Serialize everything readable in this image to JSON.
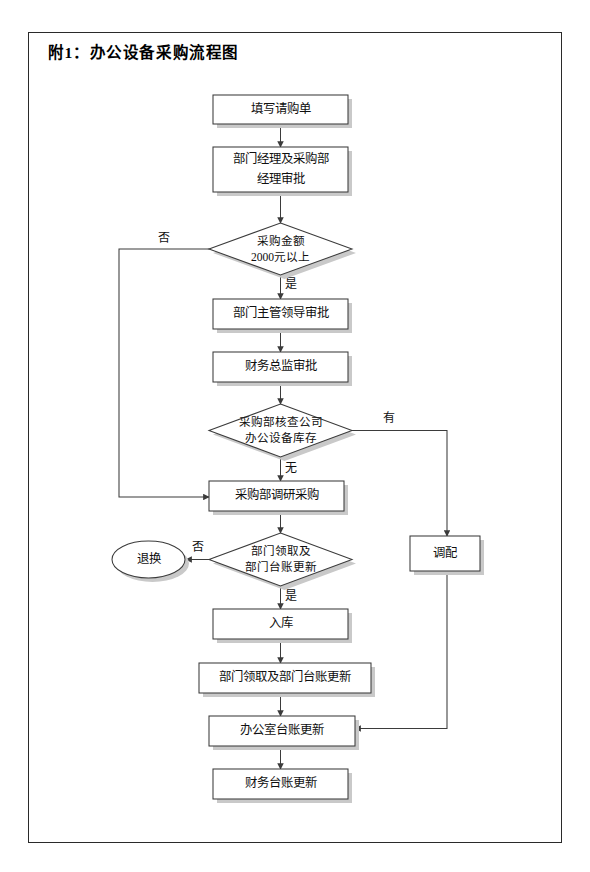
{
  "document": {
    "title": "附1：办公设备采购流程图"
  },
  "flowchart": {
    "type": "flowchart",
    "nodes": [
      {
        "id": "n1",
        "shape": "process",
        "label": "填写请购单"
      },
      {
        "id": "n2",
        "shape": "process",
        "label_line1": "部门经理及采购部",
        "label_line2": "经理审批"
      },
      {
        "id": "d1",
        "shape": "decision",
        "label_line1": "采购金额",
        "label_line2": "2000元以上"
      },
      {
        "id": "n3",
        "shape": "process",
        "label": "部门主管领导审批"
      },
      {
        "id": "n4",
        "shape": "process",
        "label": "财务总监审批"
      },
      {
        "id": "d2",
        "shape": "decision",
        "label_line1": "采购部核查公司",
        "label_line2": "办公设备库存"
      },
      {
        "id": "n5",
        "shape": "process",
        "label": "采购部调研采购"
      },
      {
        "id": "d3",
        "shape": "decision",
        "label_line1": "部门领取及",
        "label_line2": "部门台账更新"
      },
      {
        "id": "n6",
        "shape": "terminator",
        "label": "退换"
      },
      {
        "id": "n7",
        "shape": "process",
        "label": "调配"
      },
      {
        "id": "n8",
        "shape": "process",
        "label": "入库"
      },
      {
        "id": "n9",
        "shape": "process",
        "label": "部门领取及部门台账更新"
      },
      {
        "id": "n10",
        "shape": "process",
        "label": "办公室台账更新"
      },
      {
        "id": "n11",
        "shape": "process",
        "label": "财务台账更新"
      }
    ],
    "edge_labels": {
      "d1_no": "否",
      "d1_yes": "是",
      "d2_yes": "有",
      "d2_no": "无",
      "d3_no": "否",
      "d3_yes": "是"
    }
  }
}
